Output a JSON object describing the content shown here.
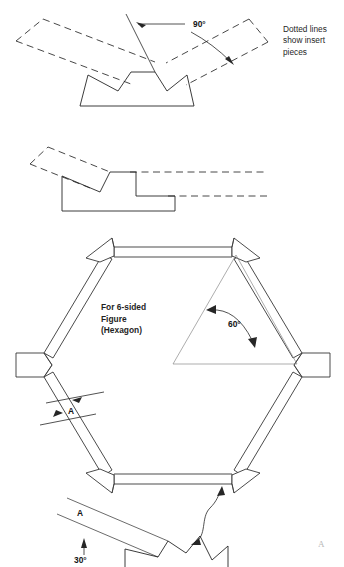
{
  "sheet": {
    "width": 344,
    "height": 567,
    "background": "#ffffff",
    "line_color": "#262626"
  },
  "notes": {
    "dotted_lines_note": "Dotted lines\nshow insert\npieces"
  },
  "figures": {
    "top_joint": {
      "name": "v-block-90-degree-joint",
      "angle_label": "90°",
      "description": "Trapezoidal block with two V-notches; dashed insert pieces extend outward at 90 degrees"
    },
    "middle_joint": {
      "name": "stepped-lap-joint",
      "description": "Stepped profile block with dashed insert pieces extending up-left and right"
    },
    "hexagon": {
      "name": "six-sided-hexagon-frame",
      "caption": "For 6-sided\nFigure\n(Hexagon)",
      "interior_angle_label": "60°",
      "width_dimension_label": "A",
      "sides": 6
    },
    "bottom_detail": {
      "name": "miter-cut-detail",
      "angle_label": "30°",
      "width_dimension_label": "A"
    }
  },
  "edge": {
    "cut_off_mark": "A"
  }
}
